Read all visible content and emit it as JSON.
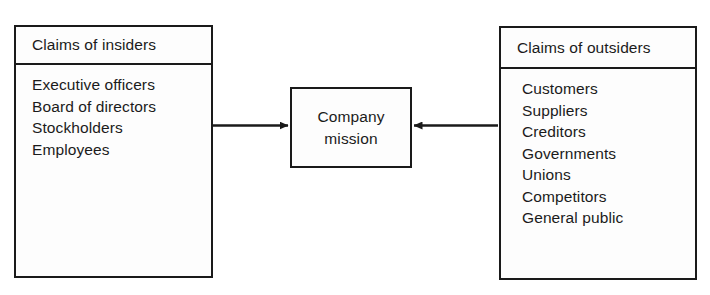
{
  "diagram": {
    "background_color": "#ffffff",
    "line_color": "#1a1a1a",
    "text_color": "#1b1b1b",
    "left_box": {
      "header": "Claims of insiders",
      "items": [
        "Executive officers",
        "Board of directors",
        "Stockholders",
        "Employees"
      ]
    },
    "center_box": {
      "line1": "Company",
      "line2": "mission"
    },
    "right_box": {
      "header": "Claims of outsiders",
      "items": [
        "Customers",
        "Suppliers",
        "Creditors",
        "Governments",
        "Unions",
        "Competitors",
        "General public"
      ]
    },
    "connectors": [
      {
        "name": "insiders-to-mission",
        "direction": "right"
      },
      {
        "name": "outsiders-to-mission",
        "direction": "left"
      }
    ]
  }
}
